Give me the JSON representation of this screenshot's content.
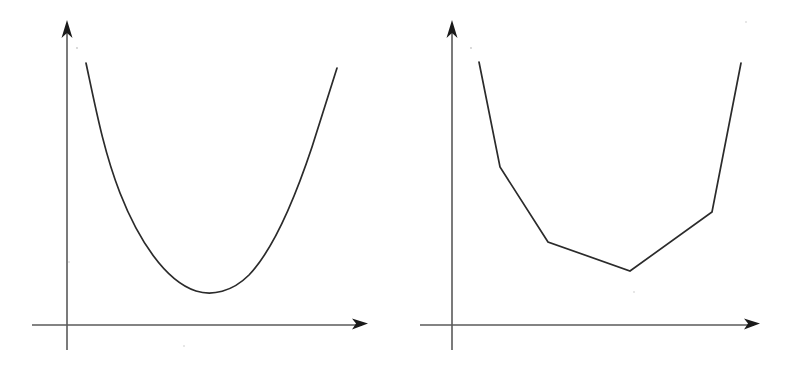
{
  "figure": {
    "width": 787,
    "height": 367,
    "background_color": "#ffffff",
    "panel_count": 2,
    "panel_labels": [
      "",
      ""
    ]
  },
  "style": {
    "axis_color": "#5a5a5a",
    "arrowhead_color": "#1a1a1a",
    "curve_color": "#2b2b2b",
    "curve_stroke_width": 1.7,
    "axis_stroke_width": 1.6
  },
  "chart_data": [
    {
      "type": "line",
      "title": "",
      "subtitle": "",
      "xlabel": "",
      "ylabel": "",
      "panel_name": "smooth-convex-curve",
      "grid": false,
      "legend": "none",
      "tick_labels_x": [],
      "tick_labels_y": [],
      "annotations": [],
      "axes": {
        "x_axis": {
          "y": 325,
          "x_start": 32,
          "x_end": 368,
          "arrow": "right"
        },
        "y_axis": {
          "x": 67,
          "y_start": 350,
          "y_end": 20,
          "arrow": "up"
        }
      },
      "xlim": [
        0,
        394
      ],
      "ylim": [
        0,
        367
      ],
      "interpolation": "smooth",
      "x": [
        86,
        110,
        140,
        175,
        212,
        250,
        285,
        315,
        337
      ],
      "y": [
        63,
        135,
        196,
        254,
        293,
        274,
        210,
        130,
        68
      ],
      "points_px": [
        [
          86,
          63
        ],
        [
          110,
          135
        ],
        [
          140,
          196
        ],
        [
          175,
          254
        ],
        [
          212,
          293
        ],
        [
          250,
          274
        ],
        [
          285,
          210
        ],
        [
          315,
          130
        ],
        [
          337,
          68
        ]
      ],
      "path_d": "M 86 63 C 96 110 104 152 120 193 C 138 239 165 281 196 291 C 212 296 232 292 249 275 C 270 253 292 207 312 147 C 320 122 330 90 337 68",
      "minimum_px": [
        212,
        293
      ],
      "description": "smooth U-shaped convex curve"
    },
    {
      "type": "line",
      "title": "",
      "subtitle": "",
      "xlabel": "",
      "ylabel": "",
      "panel_name": "piecewise-linear-curve",
      "grid": false,
      "legend": "none",
      "tick_labels_x": [],
      "tick_labels_y": [],
      "annotations": [],
      "axes": {
        "x_axis": {
          "y": 325,
          "x_start": 26,
          "x_end": 366,
          "arrow": "right"
        },
        "y_axis": {
          "x": 58,
          "y_start": 350,
          "y_end": 20,
          "arrow": "up"
        }
      },
      "xlim": [
        0,
        393
      ],
      "ylim": [
        0,
        367
      ],
      "interpolation": "linear",
      "x": [
        85,
        106,
        154,
        236,
        318,
        347
      ],
      "y": [
        62,
        167,
        242,
        271,
        212,
        63
      ],
      "points_px": [
        [
          85,
          62
        ],
        [
          106,
          167
        ],
        [
          154,
          242
        ],
        [
          236,
          271
        ],
        [
          318,
          212
        ],
        [
          347,
          63
        ]
      ],
      "path_d": "M 85 62 L 106 167 L 154 242 L 236 271 L 318 212 L 347 63",
      "minimum_px": [
        236,
        271
      ],
      "vertex_count": 6,
      "description": "piecewise-linear V-shaped curve with five segments"
    }
  ]
}
